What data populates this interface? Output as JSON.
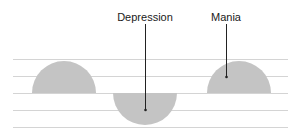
{
  "diagram": {
    "title": "",
    "labels": {
      "depression": "Depression",
      "mania": "Mania"
    },
    "baseline_lines_y": [
      59,
      76,
      93,
      110,
      127
    ],
    "line_x_range": [
      13,
      288
    ],
    "shapes": [
      {
        "name": "normal-mood-hump",
        "direction": "up",
        "cx": 64,
        "cy": 93,
        "r": 32
      },
      {
        "name": "depression-trough",
        "direction": "down",
        "cx": 145,
        "cy": 93,
        "r": 32
      },
      {
        "name": "mania-hump",
        "direction": "up",
        "cx": 239,
        "cy": 93,
        "r": 32
      }
    ],
    "colors": {
      "shape_fill": "#c4c4c4",
      "line_stroke": "#d4d4d4",
      "leader": "#222222",
      "text": "#1a1a1a"
    }
  }
}
